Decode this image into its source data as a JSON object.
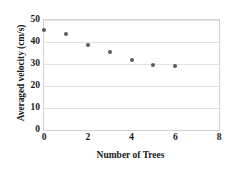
{
  "chart_data": {
    "type": "scatter",
    "title": "",
    "xlabel": "Number  of Trees",
    "ylabel": "Averaged velocity (cm/s)",
    "xlim": [
      0,
      8
    ],
    "ylim": [
      0,
      50
    ],
    "xticks": [
      "0",
      "2",
      "4",
      "6",
      "8"
    ],
    "xtick_values": [
      0,
      2,
      4,
      6,
      8
    ],
    "yticks": [
      "0",
      "10",
      "20",
      "30",
      "40",
      "50"
    ],
    "ytick_values": [
      0,
      10,
      20,
      30,
      40,
      50
    ],
    "grid": "horizontal",
    "legend": "none",
    "marker_color": "#5a5a5a",
    "grid_color": "#e2e2e2",
    "frame_color": "#d2d2d2",
    "x": [
      0,
      1,
      2,
      3,
      4,
      5,
      6
    ],
    "values": [
      45.5,
      43.6,
      38.6,
      35.5,
      32.0,
      29.5,
      29.0
    ],
    "series": [
      {
        "name": "Averaged velocity",
        "points": [
          {
            "x": 0,
            "y": 45.5
          },
          {
            "x": 1,
            "y": 43.6
          },
          {
            "x": 2,
            "y": 38.6
          },
          {
            "x": 3,
            "y": 35.5
          },
          {
            "x": 4,
            "y": 32.0
          },
          {
            "x": 5,
            "y": 29.5
          },
          {
            "x": 6,
            "y": 29.0
          }
        ]
      }
    ]
  }
}
